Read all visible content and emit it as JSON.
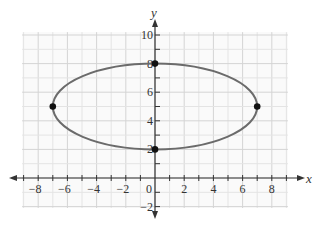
{
  "chart_data": {
    "type": "line",
    "title": "",
    "equation": "x^2/49 + (y-5)^2/9 = 1",
    "xlabel": "x",
    "ylabel": "y",
    "xlim": [
      -9,
      9
    ],
    "ylim": [
      -2,
      10
    ],
    "grid": true,
    "x_ticks": [
      -8,
      -6,
      -4,
      -2,
      0,
      2,
      4,
      6,
      8
    ],
    "x_tick_labels": [
      "−8",
      "−6",
      "−4",
      "−2",
      "0",
      "2",
      "4",
      "6",
      "8"
    ],
    "y_ticks": [
      -2,
      2,
      4,
      6,
      8,
      10
    ],
    "y_tick_labels": [
      "−2",
      "2",
      "4",
      "6",
      "8",
      "10"
    ],
    "series": [
      {
        "name": "ellipse",
        "shape": "ellipse",
        "center": [
          0,
          5
        ],
        "a": 7,
        "b": 3,
        "color": "#6b6b6b"
      }
    ],
    "points": [
      {
        "x": 0,
        "y": 8,
        "label": "top vertex"
      },
      {
        "x": 0,
        "y": 2,
        "label": "bottom vertex"
      },
      {
        "x": -7,
        "y": 5,
        "label": "left vertex"
      },
      {
        "x": 7,
        "y": 5,
        "label": "right vertex"
      }
    ],
    "colors": {
      "curve": "#6b6b6b",
      "points": "#111111",
      "axis": "#333333",
      "grid_minor": "#e4e4e4",
      "grid_major": "#d4d4d4"
    }
  }
}
